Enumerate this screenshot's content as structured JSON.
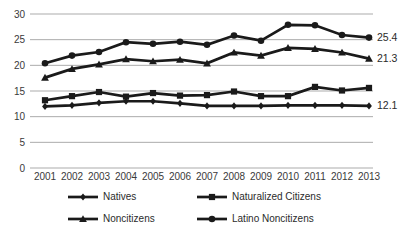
{
  "chart_data": {
    "type": "line",
    "title": "",
    "xlabel": "",
    "ylabel": "",
    "x": [
      "2001",
      "2002",
      "2003",
      "2004",
      "2005",
      "2006",
      "2007",
      "2008",
      "2009",
      "2010",
      "2011",
      "2012",
      "2013"
    ],
    "ylim": [
      0,
      30
    ],
    "yticks": [
      0,
      5,
      10,
      15,
      20,
      25,
      30
    ],
    "grid": true,
    "legend_position": "bottom",
    "series": [
      {
        "name": "Natives",
        "marker": "diamond",
        "values": [
          12.0,
          12.2,
          12.7,
          13.0,
          13.0,
          12.6,
          12.1,
          12.1,
          12.1,
          12.2,
          12.2,
          12.2,
          12.1
        ],
        "end_label": "12.1"
      },
      {
        "name": "Naturalized Citizens",
        "marker": "square",
        "values": [
          13.2,
          14.0,
          14.8,
          13.9,
          14.6,
          14.1,
          14.2,
          14.9,
          14.0,
          14.0,
          15.8,
          15.1,
          15.6
        ],
        "end_label": ""
      },
      {
        "name": "Noncitizens",
        "marker": "triangle",
        "values": [
          17.6,
          19.3,
          20.2,
          21.2,
          20.8,
          21.1,
          20.4,
          22.5,
          21.9,
          23.4,
          23.2,
          22.5,
          21.3
        ],
        "end_label": "21.3"
      },
      {
        "name": "Latino Noncitizens",
        "marker": "circle",
        "values": [
          20.4,
          21.9,
          22.6,
          24.5,
          24.2,
          24.6,
          24.0,
          25.8,
          24.8,
          27.9,
          27.8,
          25.9,
          25.4
        ],
        "end_label": "25.4"
      }
    ],
    "colors": {
      "line": "#1a1a1a",
      "grid": "#ababab",
      "labels": "#3a3a3a",
      "background": "#ffffff"
    }
  }
}
